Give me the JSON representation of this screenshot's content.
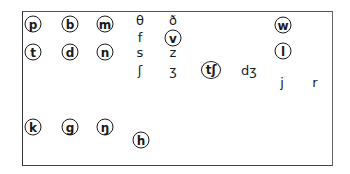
{
  "diagram": {
    "symbols": [
      {
        "id": "p",
        "text": "p",
        "circled": true,
        "x": 33,
        "y": 24
      },
      {
        "id": "b",
        "text": "b",
        "circled": true,
        "x": 70,
        "y": 24
      },
      {
        "id": "m",
        "text": "m",
        "circled": true,
        "x": 105,
        "y": 24
      },
      {
        "id": "theta",
        "text": "θ",
        "circled": false,
        "x": 140,
        "y": 20
      },
      {
        "id": "eth",
        "text": "ð",
        "circled": false,
        "x": 173,
        "y": 20
      },
      {
        "id": "w",
        "text": "w",
        "circled": true,
        "x": 283,
        "y": 25
      },
      {
        "id": "f",
        "text": "f",
        "circled": false,
        "x": 140,
        "y": 37
      },
      {
        "id": "v",
        "text": "v",
        "circled": true,
        "x": 173,
        "y": 38
      },
      {
        "id": "t",
        "text": "t",
        "circled": true,
        "x": 33,
        "y": 52
      },
      {
        "id": "d",
        "text": "d",
        "circled": true,
        "x": 70,
        "y": 52
      },
      {
        "id": "n",
        "text": "n",
        "circled": true,
        "x": 105,
        "y": 52
      },
      {
        "id": "s",
        "text": "s",
        "circled": false,
        "x": 140,
        "y": 52
      },
      {
        "id": "z",
        "text": "z",
        "circled": false,
        "x": 173,
        "y": 52
      },
      {
        "id": "l",
        "text": "l",
        "circled": true,
        "x": 283,
        "y": 51
      },
      {
        "id": "esh",
        "text": "ʃ",
        "circled": false,
        "x": 140,
        "y": 70
      },
      {
        "id": "ezh",
        "text": "ʒ",
        "circled": false,
        "x": 173,
        "y": 70
      },
      {
        "id": "tesh",
        "text": "tʃ",
        "circled": true,
        "x": 211,
        "y": 70
      },
      {
        "id": "dezh",
        "text": "dʒ",
        "circled": false,
        "x": 249,
        "y": 70
      },
      {
        "id": "j",
        "text": "j",
        "circled": false,
        "x": 282,
        "y": 82
      },
      {
        "id": "r",
        "text": "r",
        "circled": false,
        "x": 315,
        "y": 82
      },
      {
        "id": "k",
        "text": "k",
        "circled": true,
        "x": 33,
        "y": 127
      },
      {
        "id": "g",
        "text": "g",
        "circled": true,
        "x": 70,
        "y": 127
      },
      {
        "id": "eng",
        "text": "ŋ",
        "circled": true,
        "x": 105,
        "y": 127
      },
      {
        "id": "h",
        "text": "h",
        "circled": true,
        "x": 141,
        "y": 140
      }
    ]
  }
}
